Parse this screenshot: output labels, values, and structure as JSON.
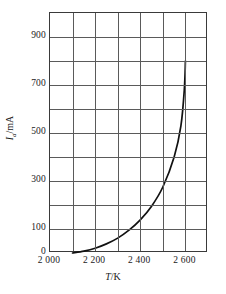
{
  "chart_data": {
    "type": "line",
    "title": "",
    "xlabel": "T/K",
    "ylabel": "I_a/mA",
    "ylabel_symbol": "I",
    "ylabel_subscript": "a",
    "ylabel_unit": "/mA",
    "xlabel_symbol": "T",
    "xlabel_unit": "/K",
    "xlim": [
      2000,
      2700
    ],
    "ylim": [
      0,
      1000
    ],
    "grid": true,
    "grid_x_step": 100,
    "grid_y_step": 100,
    "legend": "none",
    "x_tick_labels": [
      "2 000",
      "2 200",
      "2 400",
      "2 600"
    ],
    "x_tick_values": [
      2000,
      2200,
      2400,
      2600
    ],
    "y_tick_labels": [
      "0",
      "100",
      "300",
      "500",
      "700",
      "900"
    ],
    "y_tick_values": [
      0,
      100,
      300,
      500,
      700,
      900
    ],
    "series": [
      {
        "name": "emission current",
        "color": "#111111",
        "x": [
          2100,
          2150,
          2200,
          2250,
          2300,
          2350,
          2400,
          2450,
          2500,
          2550,
          2580,
          2595,
          2600
        ],
        "y": [
          0,
          8,
          20,
          38,
          62,
          95,
          138,
          195,
          275,
          400,
          530,
          680,
          800
        ]
      }
    ]
  },
  "colors": {
    "frame": "#3a3a3a",
    "grid": "#5a5a5a",
    "curve": "#111111",
    "background": "#ffffff",
    "text": "#1a1a1a"
  }
}
